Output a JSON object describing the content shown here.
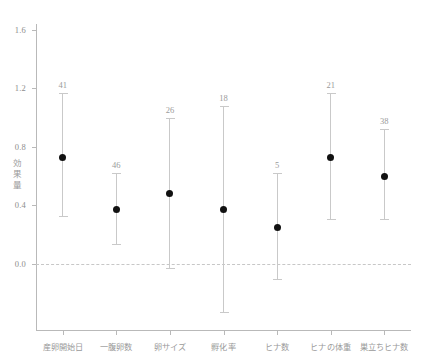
{
  "chart_data": {
    "type": "scatter",
    "title": "",
    "subtitle": "",
    "xlabel": "",
    "ylabel": "効果量",
    "ylim": [
      -0.45,
      1.68
    ],
    "grid": false,
    "legend": null,
    "reference_line": {
      "value": 0.0,
      "style": "dashed"
    },
    "yticks": [
      0.0,
      0.4,
      0.8,
      1.2,
      1.6
    ],
    "ytick_labels": [
      "0.0",
      "0.4",
      "0.8",
      "1.2",
      "1.6"
    ],
    "categories": [
      "産卵開始日",
      "一腹卵数",
      "卵サイズ",
      "孵化率",
      "ヒナ数",
      "ヒナの体重",
      "巣立ちヒナ数"
    ],
    "values": [
      0.73,
      0.37,
      0.48,
      0.37,
      0.25,
      0.73,
      0.6
    ],
    "ci_lower": [
      0.33,
      0.14,
      -0.03,
      -0.33,
      -0.1,
      0.31,
      0.31
    ],
    "ci_upper": [
      1.17,
      0.62,
      1.0,
      1.08,
      0.62,
      1.17,
      0.92
    ],
    "n_labels": [
      "41",
      "46",
      "26",
      "18",
      "5",
      "21",
      "38"
    ],
    "points": [
      {
        "category": "産卵開始日",
        "value": 0.73,
        "ci_lower": 0.33,
        "ci_upper": 1.17,
        "n": "41"
      },
      {
        "category": "一腹卵数",
        "value": 0.37,
        "ci_lower": 0.14,
        "ci_upper": 0.62,
        "n": "46"
      },
      {
        "category": "卵サイズ",
        "value": 0.48,
        "ci_lower": -0.03,
        "ci_upper": 1.0,
        "n": "26"
      },
      {
        "category": "孵化率",
        "value": 0.37,
        "ci_lower": -0.33,
        "ci_upper": 1.08,
        "n": "18"
      },
      {
        "category": "ヒナ数",
        "value": 0.25,
        "ci_lower": -0.1,
        "ci_upper": 0.62,
        "n": "5"
      },
      {
        "category": "ヒナの体重",
        "value": 0.73,
        "ci_lower": 0.31,
        "ci_upper": 1.17,
        "n": "21"
      },
      {
        "category": "巣立ちヒナ数",
        "value": 0.6,
        "ci_lower": 0.31,
        "ci_upper": 0.92,
        "n": "38"
      }
    ],
    "colors": {
      "point": "#111111",
      "errorbar": "#c9c9c9",
      "axis": "#b9b9b9",
      "text": "#9a9a9a",
      "reference_line": "#c7c7c7",
      "background": "#ffffff"
    }
  },
  "y_axis_title_chars": [
    "効",
    "果",
    "量"
  ]
}
